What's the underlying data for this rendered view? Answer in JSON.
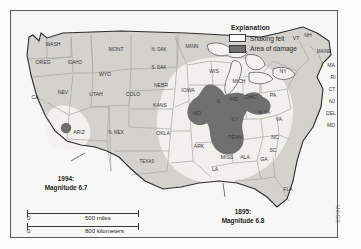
{
  "figure": {
    "credit": "USGS",
    "frame_color": "#5a5a5a",
    "background_color": "#f7f7f5"
  },
  "legend": {
    "title": "Explanation",
    "items": [
      {
        "label": "Shaking felt",
        "color": "#ffffff",
        "swatch": "shaking-felt-swatch"
      },
      {
        "label": "Area of damage",
        "color": "#6f6f6f",
        "swatch": "area-of-damage-swatch"
      }
    ]
  },
  "events": [
    {
      "id": "west",
      "year": "1994:",
      "magnitude": "Magnitude 6.7"
    },
    {
      "id": "east",
      "year": "1895:",
      "magnitude": "Magnitude 6.8"
    }
  ],
  "scale": {
    "bars": [
      {
        "zero": "0",
        "value": "500 miles"
      },
      {
        "zero": "0",
        "value": "800 kilometers"
      }
    ]
  },
  "map": {
    "state_labels": [
      {
        "text": "WASH",
        "x": 42,
        "y": 35
      },
      {
        "text": "OREG",
        "x": 32,
        "y": 53
      },
      {
        "text": "IDAHO",
        "x": 64,
        "y": 53
      },
      {
        "text": "MONT",
        "x": 105,
        "y": 40
      },
      {
        "text": "N. DAK",
        "x": 148,
        "y": 40
      },
      {
        "text": "S. DAK",
        "x": 148,
        "y": 58
      },
      {
        "text": "WYO",
        "x": 94,
        "y": 65
      },
      {
        "text": "NEV",
        "x": 52,
        "y": 83
      },
      {
        "text": "UTAH",
        "x": 85,
        "y": 85
      },
      {
        "text": "COLO",
        "x": 122,
        "y": 85
      },
      {
        "text": "NEBR",
        "x": 150,
        "y": 76
      },
      {
        "text": "KANS",
        "x": 149,
        "y": 96
      },
      {
        "text": "CA",
        "x": 24,
        "y": 88
      },
      {
        "text": "ARIZ",
        "x": 68,
        "y": 123
      },
      {
        "text": "N. MEX",
        "x": 105,
        "y": 123
      },
      {
        "text": "OKLA",
        "x": 152,
        "y": 124
      },
      {
        "text": "TEXAS",
        "x": 136,
        "y": 152
      },
      {
        "text": "MINN",
        "x": 181,
        "y": 37
      },
      {
        "text": "IOWA",
        "x": 177,
        "y": 81
      },
      {
        "text": "WIS",
        "x": 203,
        "y": 62
      },
      {
        "text": "MICH",
        "x": 228,
        "y": 72
      },
      {
        "text": "MO",
        "x": 186,
        "y": 104
      },
      {
        "text": "ARK",
        "x": 188,
        "y": 137
      },
      {
        "text": "LA",
        "x": 204,
        "y": 160
      },
      {
        "text": "MISS",
        "x": 216,
        "y": 148
      },
      {
        "text": "ALA",
        "x": 234,
        "y": 148
      },
      {
        "text": "GA",
        "x": 253,
        "y": 150
      },
      {
        "text": "FLA",
        "x": 277,
        "y": 180
      },
      {
        "text": "IL",
        "x": 208,
        "y": 92
      },
      {
        "text": "IND",
        "x": 223,
        "y": 90
      },
      {
        "text": "OHIO",
        "x": 240,
        "y": 88
      },
      {
        "text": "KY",
        "x": 224,
        "y": 110
      },
      {
        "text": "TENN",
        "x": 224,
        "y": 128
      },
      {
        "text": "W. VA",
        "x": 253,
        "y": 103
      },
      {
        "text": "VA",
        "x": 268,
        "y": 110
      },
      {
        "text": "NC",
        "x": 264,
        "y": 128
      },
      {
        "text": "SC",
        "x": 262,
        "y": 141
      },
      {
        "text": "PA",
        "x": 262,
        "y": 86
      },
      {
        "text": "NY",
        "x": 272,
        "y": 62
      },
      {
        "text": "VT",
        "x": 285,
        "y": 29
      },
      {
        "text": "NH",
        "x": 297,
        "y": 26
      },
      {
        "text": "MAINE",
        "x": 313,
        "y": 42
      },
      {
        "text": "MA",
        "x": 320,
        "y": 56
      },
      {
        "text": "RI",
        "x": 322,
        "y": 68
      },
      {
        "text": "CT",
        "x": 321,
        "y": 80
      },
      {
        "text": "NJ",
        "x": 321,
        "y": 92
      },
      {
        "text": "DEL",
        "x": 320,
        "y": 104
      },
      {
        "text": "MD",
        "x": 320,
        "y": 116
      }
    ]
  }
}
